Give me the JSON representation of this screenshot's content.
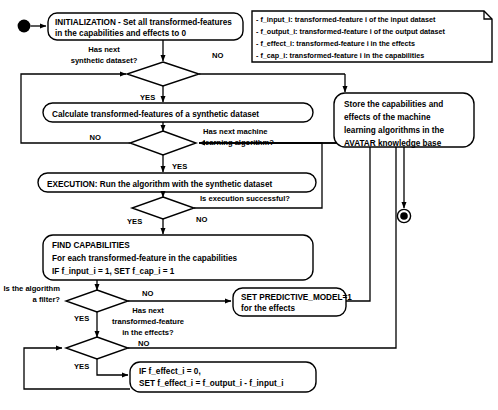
{
  "diagram": {
    "colors": {
      "stroke": "#000000",
      "fill": "#ffffff",
      "text": "#000000"
    },
    "start_node": "start-state",
    "end_node": "end-state",
    "nodes": {
      "initialization": {
        "line1": "INITIALIZATION - Set all transformed-features",
        "line2": "in the capabilities and effects to 0"
      },
      "calculate": {
        "line1": "Calculate transformed-features of a synthetic dataset"
      },
      "execution": {
        "line1": "EXECUTION: Run the algorithm with the synthetic dataset"
      },
      "find_capabilities": {
        "line1": "FIND CAPABILITIES",
        "line2": "For each transformed-feature in the capabilities",
        "line3": "IF f_input_i = 1, SET f_cap_i = 1"
      },
      "set_predictive_model": {
        "line1": "SET PREDICTIVE_MODEL=1",
        "line2": "for the effects"
      },
      "set_effect": {
        "line1": "IF f_effect_i = 0,",
        "line2": "SET f_effect_i = f_output_i - f_input_i"
      },
      "store": {
        "line1": "Store the capabilities and",
        "line2": "effects of the machine",
        "line3": "learning algorithms in the",
        "line4": "AVATAR knowledge base"
      }
    },
    "decisions": {
      "has_next_dataset": {
        "line1": "Has next",
        "line2": "synthetic dataset?"
      },
      "has_next_algorithm": {
        "line1": "Has next machine",
        "line2": "learning algorithm?"
      },
      "execution_successful": {
        "line1": "Is execution successful?"
      },
      "is_filter": {
        "line1": "Is the algorithm",
        "line2": "a filter?"
      },
      "has_next_feature": {
        "line1": "Has next",
        "line2": "transformed-feature",
        "line3": "in the effects?"
      }
    },
    "edge_labels": {
      "dataset_no": "NO",
      "dataset_yes": "YES",
      "algorithm_no": "NO",
      "algorithm_yes": "YES",
      "exec_yes": "YES",
      "exec_no": "NO",
      "filter_no": "NO",
      "filter_yes": "YES",
      "feature_no": "NO",
      "feature_yes": "YES"
    },
    "legend": {
      "items": [
        "- f_input_i: transformed-feature i of the input dataset",
        "- f_output_i: transformed-feature i of the output dataset",
        "- f_effect_i: transformed-feature i in the effects",
        "- f_cap_i: transformed-feature i in the capabilities"
      ]
    }
  }
}
